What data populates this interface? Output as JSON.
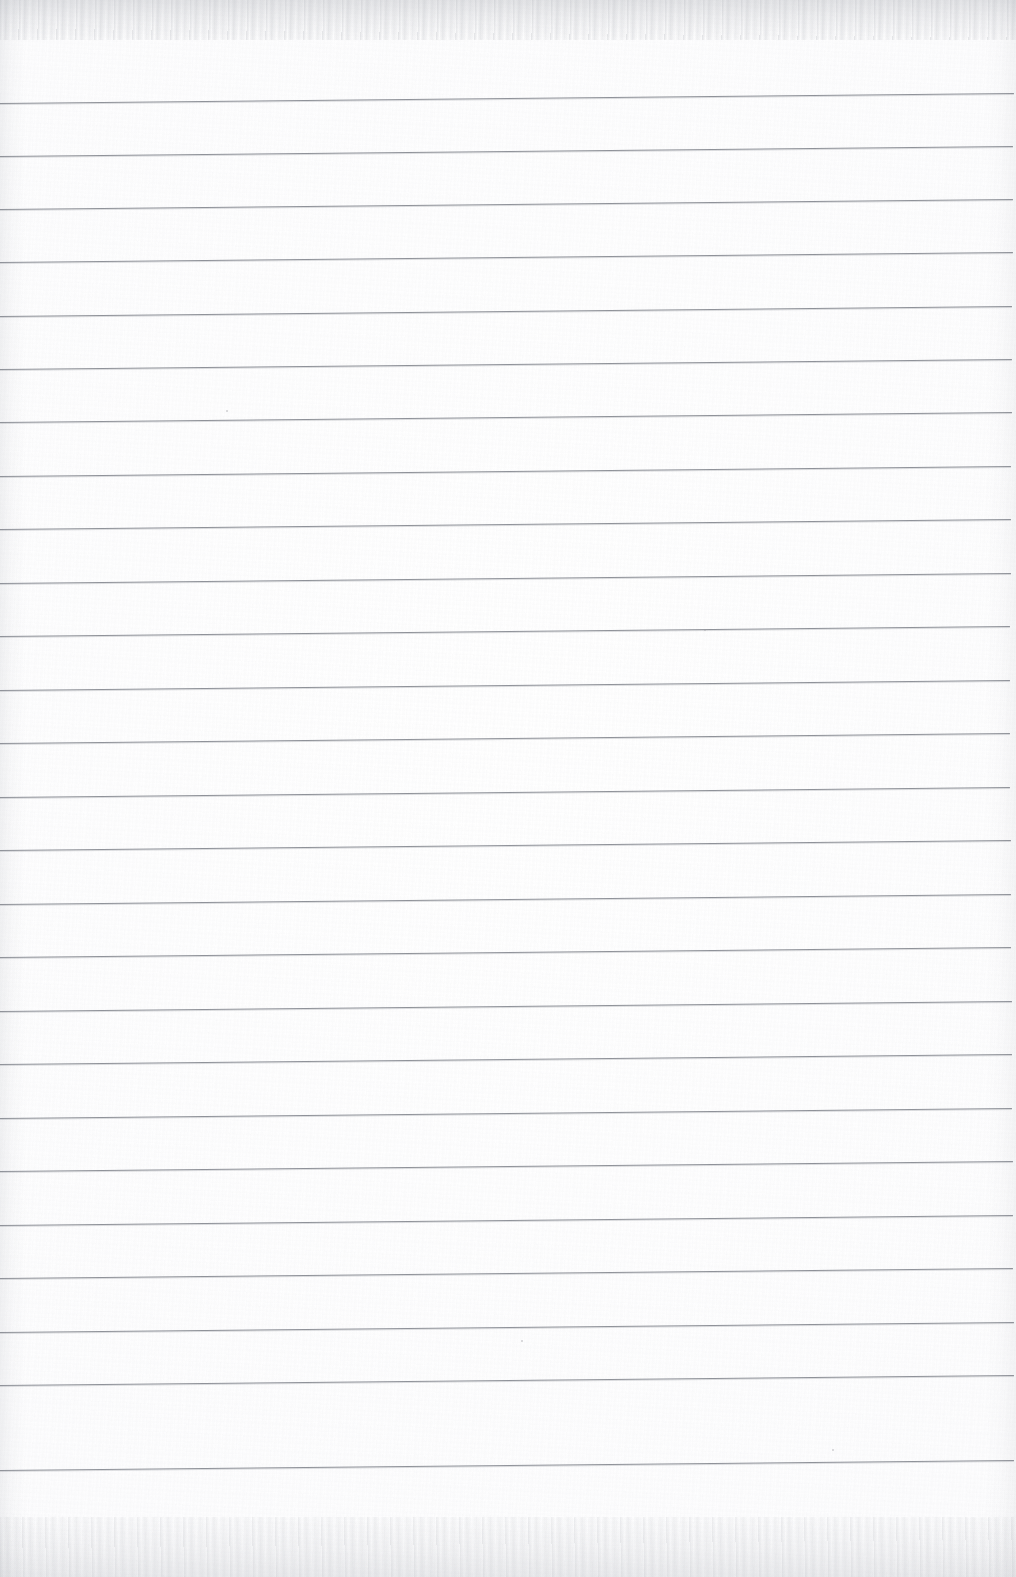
{
  "document": {
    "kind": "scanned-ruled-notebook-page",
    "title": "Blank Lined Notebook Page",
    "width": 1016,
    "height": 1577,
    "has_text": false,
    "has_handwriting": false,
    "visible_text": "",
    "paper_color": "#fdfdfd",
    "rule_color": "#8f9299",
    "edge_tint_color": "#a0a3aa"
  },
  "ruling": {
    "type": "horizontal-ruled",
    "line_count": 26,
    "spacing_px": 53,
    "first_line_y_left": 103,
    "slope_rise_px": -10,
    "line_start_x": 0,
    "line_end_x": 1014,
    "margin_rule": false,
    "lines": [
      {
        "index": 1,
        "y_left": 103,
        "y_right": 93,
        "x_start": 0,
        "x_end": 1014
      },
      {
        "index": 2,
        "y_left": 156,
        "y_right": 146,
        "x_start": 0,
        "x_end": 1013
      },
      {
        "index": 3,
        "y_left": 209,
        "y_right": 199,
        "x_start": 0,
        "x_end": 1013
      },
      {
        "index": 4,
        "y_left": 262,
        "y_right": 252,
        "x_start": 0,
        "x_end": 1013
      },
      {
        "index": 5,
        "y_left": 316,
        "y_right": 306,
        "x_start": 0,
        "x_end": 1012
      },
      {
        "index": 6,
        "y_left": 369,
        "y_right": 359,
        "x_start": 0,
        "x_end": 1012
      },
      {
        "index": 7,
        "y_left": 422,
        "y_right": 412,
        "x_start": 0,
        "x_end": 1012
      },
      {
        "index": 8,
        "y_left": 476,
        "y_right": 466,
        "x_start": 0,
        "x_end": 1011
      },
      {
        "index": 9,
        "y_left": 529,
        "y_right": 519,
        "x_start": 0,
        "x_end": 1011
      },
      {
        "index": 10,
        "y_left": 583,
        "y_right": 573,
        "x_start": 0,
        "x_end": 1011
      },
      {
        "index": 11,
        "y_left": 636,
        "y_right": 626,
        "x_start": 0,
        "x_end": 1010
      },
      {
        "index": 12,
        "y_left": 690,
        "y_right": 680,
        "x_start": 0,
        "x_end": 1010
      },
      {
        "index": 13,
        "y_left": 743,
        "y_right": 733,
        "x_start": 0,
        "x_end": 1010
      },
      {
        "index": 14,
        "y_left": 797,
        "y_right": 787,
        "x_start": 0,
        "x_end": 1010
      },
      {
        "index": 15,
        "y_left": 850,
        "y_right": 840,
        "x_start": 0,
        "x_end": 1011
      },
      {
        "index": 16,
        "y_left": 904,
        "y_right": 894,
        "x_start": 0,
        "x_end": 1011
      },
      {
        "index": 17,
        "y_left": 957,
        "y_right": 947,
        "x_start": 0,
        "x_end": 1011
      },
      {
        "index": 18,
        "y_left": 1011,
        "y_right": 1001,
        "x_start": 0,
        "x_end": 1012
      },
      {
        "index": 19,
        "y_left": 1064,
        "y_right": 1054,
        "x_start": 0,
        "x_end": 1012
      },
      {
        "index": 20,
        "y_left": 1118,
        "y_right": 1108,
        "x_start": 0,
        "x_end": 1012
      },
      {
        "index": 21,
        "y_left": 1171,
        "y_right": 1161,
        "x_start": 0,
        "x_end": 1013
      },
      {
        "index": 22,
        "y_left": 1225,
        "y_right": 1215,
        "x_start": 0,
        "x_end": 1013
      },
      {
        "index": 23,
        "y_left": 1278,
        "y_right": 1268,
        "x_start": 0,
        "x_end": 1013
      },
      {
        "index": 24,
        "y_left": 1332,
        "y_right": 1322,
        "x_start": 0,
        "x_end": 1014
      },
      {
        "index": 25,
        "y_left": 1385,
        "y_right": 1375,
        "x_start": 0,
        "x_end": 1014
      },
      {
        "index": 26,
        "y_left": 1470,
        "y_right": 1460,
        "x_start": 0,
        "x_end": 1014
      }
    ]
  },
  "artifacts": {
    "specks": [
      {
        "x": 521,
        "y": 1340
      },
      {
        "x": 832,
        "y": 1449
      },
      {
        "x": 226,
        "y": 410
      },
      {
        "x": 704,
        "y": 629
      }
    ],
    "top_edge_band": true,
    "bottom_edge_band": true
  }
}
